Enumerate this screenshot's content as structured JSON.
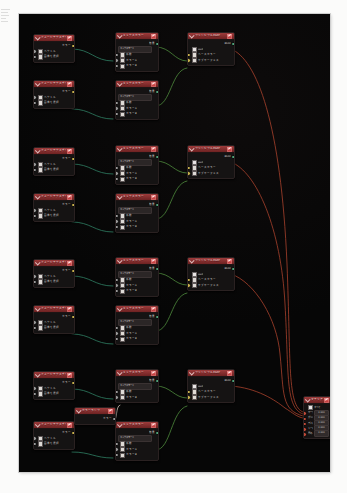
{
  "canvas": {
    "background": "#060606",
    "link_color_data": "#2f7f63",
    "link_color_shader": "#4e8a3c",
    "link_color_output": "#a8412c",
    "header_color": "#8e3333",
    "zoom_hint": ""
  },
  "icons": {
    "node_menu": "wrench-icon",
    "collapse": "chevron-down-icon",
    "checkbox": "checkbox-icon",
    "color_swatch": "color-swatch-icon"
  },
  "groups": [
    {
      "id": "group-1",
      "image_nodes": [
        {
          "title": "イメージテクスチャ",
          "out_label": "カラー",
          "rows": [
            "ベクトル",
            "画像を選択"
          ]
        },
        {
          "title": "イメージテクスチャ",
          "out_label": "カラー",
          "rows": [
            "ベクトル",
            "画像を選択"
          ]
        }
      ],
      "mix_nodes": [
        {
          "title": "ミックスカラー",
          "out_label": "結果",
          "rows": [
            "ミックスモード",
            "係数",
            "カラーA",
            "カラーB"
          ]
        },
        {
          "title": "ミックスカラー",
          "out_label": "結果",
          "rows": [
            "ミックスモード",
            "係数",
            "カラーA",
            "カラーB"
          ]
        }
      ],
      "shader_node": {
        "title": "プリンシプルBSDF",
        "out_label": "BSDF",
        "rows": [
          "GGX",
          "ベースカラー",
          "サブサーフェス"
        ]
      }
    },
    {
      "id": "group-2",
      "image_nodes": [
        {
          "title": "イメージテクスチャ",
          "out_label": "カラー",
          "rows": [
            "ベクトル",
            "画像を選択"
          ]
        },
        {
          "title": "イメージテクスチャ",
          "out_label": "カラー",
          "rows": [
            "ベクトル",
            "画像を選択"
          ]
        }
      ],
      "mix_nodes": [
        {
          "title": "ミックスカラー",
          "out_label": "結果",
          "rows": [
            "ミックスモード",
            "係数",
            "カラーA",
            "カラーB"
          ]
        },
        {
          "title": "ミックスカラー",
          "out_label": "結果",
          "rows": [
            "ミックスモード",
            "係数",
            "カラーA",
            "カラーB"
          ]
        }
      ],
      "shader_node": {
        "title": "プリンシプルBSDF",
        "out_label": "BSDF",
        "rows": [
          "GGX",
          "ベースカラー",
          "サブサーフェス"
        ]
      }
    },
    {
      "id": "group-3",
      "image_nodes": [
        {
          "title": "イメージテクスチャ",
          "out_label": "カラー",
          "rows": [
            "ベクトル",
            "画像を選択"
          ]
        },
        {
          "title": "イメージテクスチャ",
          "out_label": "カラー",
          "rows": [
            "ベクトル",
            "画像を選択"
          ]
        }
      ],
      "mix_nodes": [
        {
          "title": "ミックスカラー",
          "out_label": "結果",
          "rows": [
            "ミックスモード",
            "係数",
            "カラーA",
            "カラーB"
          ]
        },
        {
          "title": "ミックスカラー",
          "out_label": "結果",
          "rows": [
            "ミックスモード",
            "係数",
            "カラーA",
            "カラーB"
          ]
        }
      ],
      "shader_node": {
        "title": "プリンシプルBSDF",
        "out_label": "BSDF",
        "rows": [
          "GGX",
          "ベースカラー",
          "サブサーフェス"
        ]
      }
    },
    {
      "id": "group-4",
      "image_nodes": [
        {
          "title": "イメージテクスチャ",
          "out_label": "カラー",
          "rows": [
            "ベクトル",
            "画像を選択"
          ]
        },
        {
          "title": "イメージテクスチャ",
          "out_label": "カラー",
          "rows": [
            "ベクトル",
            "画像を選択"
          ]
        }
      ],
      "mix_nodes": [
        {
          "title": "ミックスカラー",
          "out_label": "結果",
          "rows": [
            "ミックスモード",
            "係数",
            "カラーB"
          ]
        },
        {
          "title": "ミックスカラー",
          "out_label": "結果",
          "rows": [
            "ミックスモード",
            "係数",
            "カラーA",
            "カラーB"
          ]
        }
      ],
      "shader_node": {
        "title": "プリンシプルBSDF",
        "out_label": "BSDF",
        "rows": [
          "GGX",
          "ベースカラー",
          "サブサーフェス"
        ]
      },
      "extra_node": {
        "title": "カラーランプ",
        "out_label": "カラー"
      }
    }
  ],
  "output_node": {
    "title": "マテリアル出力",
    "rows": [
      {
        "label": "すべて",
        "value": "",
        "type": "select"
      },
      {
        "label": "サーフェス",
        "value": "0.000",
        "type": "field"
      },
      {
        "label": "ボリューム",
        "value": "0.000",
        "type": "field"
      },
      {
        "label": "ディスプレ",
        "value": "0.000",
        "type": "field"
      },
      {
        "label": "トースト",
        "value": "0.000",
        "type": "field"
      },
      {
        "label": "厚み",
        "value": "0.000",
        "type": "field"
      }
    ]
  }
}
